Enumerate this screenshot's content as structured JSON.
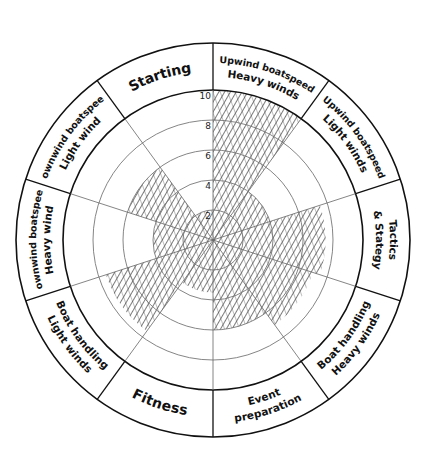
{
  "chart_data": {
    "type": "polar-area",
    "title": "",
    "scale": {
      "min": 0,
      "max": 10,
      "ticks": [
        "2",
        "4",
        "6",
        "8",
        "10"
      ]
    },
    "categories": [
      "Upwind boatspeed Heavy winds",
      "Upwind boatspeed Light winds",
      "Tactics & Stategy",
      "Boat handling Heavy winds",
      "Event preparation",
      "Fitness",
      "Boat handling Light winds",
      "Downwind boatspeed Heavy wind",
      "Downwind boatspeed Light wind",
      "Starting"
    ],
    "values": [
      10,
      4,
      7.5,
      7,
      6,
      3.5,
      7.5,
      4,
      6,
      2
    ],
    "fill": "hatched",
    "grid": true,
    "legend": "none"
  },
  "segments": [
    {
      "line1": "Upwind boatspeed",
      "line2": "Heavy winds"
    },
    {
      "line1": "Upwind boatspeed",
      "line2": "Light winds"
    },
    {
      "line1": "Tactics",
      "line2": "& Stategy"
    },
    {
      "line1": "Boat handling",
      "line2": "Heavy winds"
    },
    {
      "line1": "Event",
      "line2": "preparation"
    },
    {
      "line1": "Fitness",
      "line2": ""
    },
    {
      "line1": "Boat handling",
      "line2": "Light winds"
    },
    {
      "line1": "Downwind boatspeed",
      "line2": "Heavy wind"
    },
    {
      "line1": "Downwind boatspeed",
      "line2": "Light wind"
    },
    {
      "line1": "Starting",
      "line2": ""
    }
  ],
  "colors": {
    "ink": "#111111",
    "hatch": "#333333",
    "grid": "#777777",
    "background": "#ffffff"
  }
}
